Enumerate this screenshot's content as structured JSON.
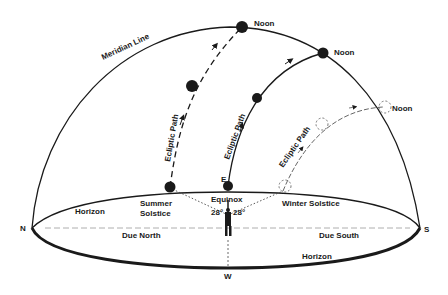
{
  "diagram": {
    "labels": {
      "meridian": "Meridian Line",
      "noon_summer": "Noon",
      "noon_equinox": "Noon",
      "noon_winter": "Noon",
      "ecliptic_summer": "Ecliptic Path",
      "ecliptic_equinox": "Ecliptic Path",
      "ecliptic_winter": "Ecliptic Path",
      "summer_solstice_1": "Summer",
      "summer_solstice_2": "Solstice",
      "equinox": "Equinox",
      "angle_left": "28°",
      "angle_right": "28°",
      "winter_solstice": "Winter Solstice",
      "east": "E",
      "west": "W",
      "north": "N",
      "south": "S",
      "horizon_back": "Horizon",
      "horizon_front": "Horizon",
      "due_north": "Due North",
      "due_south": "Due South"
    },
    "colors": {
      "ink": "#1a1a1a",
      "background": "#ffffff"
    }
  }
}
